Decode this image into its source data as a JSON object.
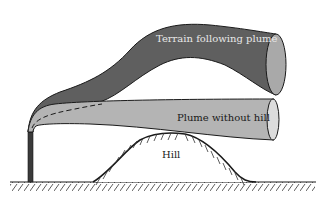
{
  "diagram": {
    "labels": {
      "terrain_plume": "Terrain following plume",
      "plume_without_hill": "Plume without hill",
      "hill": "Hill"
    },
    "colors": {
      "terrain_plume_fill": "#5f5f5f",
      "terrain_plume_end": "#a9a9a9",
      "plume_without_hill_fill": "#b4b4b4",
      "plume_without_hill_end": "#dcdcdc",
      "stack": "#3a3a3a",
      "outline": "#1a1a1a",
      "terrain_label_color": "#e8e8e8",
      "dark_label_color": "#1a1a1a"
    }
  }
}
